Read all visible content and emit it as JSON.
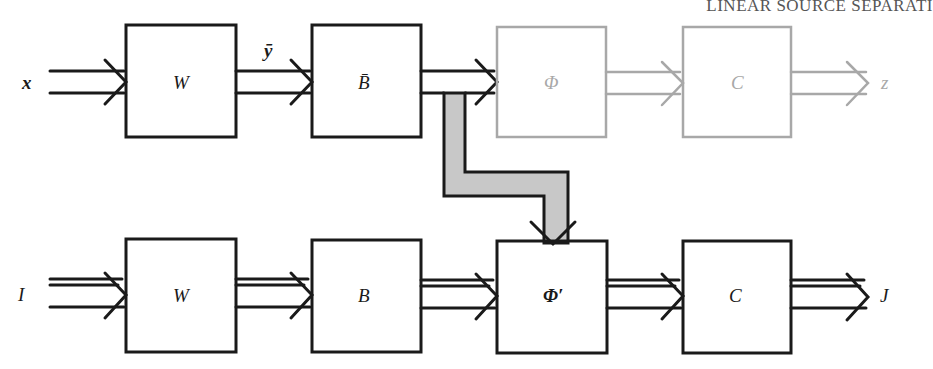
{
  "header": {
    "running_title": "LINEAR SOURCE SEPARATI"
  },
  "colors": {
    "active": "#1a1a1a",
    "faded": "#a8a8a8",
    "connector_fill": "#c8c8c8"
  },
  "top_row": {
    "input_label": "x",
    "blocks": [
      {
        "id": "W",
        "label": "W",
        "faded": false
      },
      {
        "id": "B_bar",
        "label": "B̄",
        "faded": false
      },
      {
        "id": "Phi",
        "label": "Φ",
        "faded": true
      },
      {
        "id": "C",
        "label": "C",
        "faded": true
      }
    ],
    "edge_label_W_to_Bbar": "ȳ",
    "output_label": "z"
  },
  "bottom_row": {
    "input_label": "I",
    "blocks": [
      {
        "id": "W2",
        "label": "W"
      },
      {
        "id": "B",
        "label": "B"
      },
      {
        "id": "Phi_prime",
        "label": "Φ′"
      },
      {
        "id": "C2",
        "label": "C"
      }
    ],
    "output_label": "J"
  },
  "connector": {
    "from": "B_bar output",
    "to": "Φ′ top"
  }
}
